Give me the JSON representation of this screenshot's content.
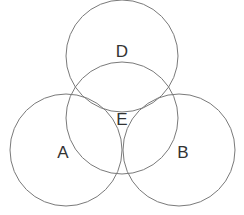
{
  "diagram": {
    "type": "venn",
    "stroke_color": "#7a7a7a",
    "label_color": "#333333",
    "circles": [
      {
        "id": "D",
        "label": "D",
        "cx": 122,
        "cy": 56,
        "r": 56,
        "label_x": 122,
        "label_y": 51
      },
      {
        "id": "E",
        "label": "E",
        "cx": 122,
        "cy": 118,
        "r": 56,
        "label_x": 122,
        "label_y": 119
      },
      {
        "id": "A",
        "label": "A",
        "cx": 66,
        "cy": 150,
        "r": 56,
        "label_x": 63,
        "label_y": 152
      },
      {
        "id": "B",
        "label": "B",
        "cx": 179,
        "cy": 150,
        "r": 56,
        "label_x": 183,
        "label_y": 152
      }
    ]
  }
}
